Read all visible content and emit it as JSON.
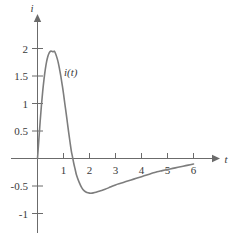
{
  "chart_data": {
    "type": "line",
    "title": "",
    "subtitle": "",
    "xlabel": "t",
    "ylabel": "i",
    "xlim": [
      -0.25,
      6.6
    ],
    "ylim": [
      -1.25,
      2.25
    ],
    "grid": false,
    "legend": "none",
    "annotations": [
      {
        "text": "i(t)",
        "x": 1.05,
        "y": 1.48
      }
    ],
    "xticks": [
      1,
      2,
      3,
      4,
      5,
      6
    ],
    "xtick_labels": [
      "1",
      "2",
      "3",
      "4",
      "5",
      "6"
    ],
    "yticks": [
      -1,
      -0.5,
      0.5,
      1,
      1.5,
      2
    ],
    "ytick_labels": [
      "-1",
      "-0.5",
      "0.5",
      "1",
      "1.5",
      "2"
    ],
    "series": [
      {
        "name": "i(t)",
        "color": "#7d7d7d",
        "x": [
          0,
          0.05,
          0.1,
          0.15,
          0.2,
          0.25,
          0.3,
          0.35,
          0.4,
          0.45,
          0.5,
          0.55,
          0.6,
          0.65,
          0.7,
          0.75,
          0.8,
          0.85,
          0.9,
          0.95,
          1.0,
          1.05,
          1.1,
          1.15,
          1.2,
          1.25,
          1.3,
          1.35,
          1.4,
          1.45,
          1.5,
          1.6,
          1.7,
          1.8,
          1.9,
          2.0,
          2.1,
          2.2,
          2.4,
          2.6,
          2.8,
          3.0,
          3.2,
          3.4,
          3.6,
          3.8,
          4.0,
          4.2,
          4.4,
          4.6,
          4.8,
          5.0,
          5.2,
          5.4,
          5.6,
          5.8,
          6.0
        ],
        "y": [
          0,
          0.33,
          0.66,
          0.96,
          1.22,
          1.44,
          1.62,
          1.76,
          1.86,
          1.92,
          1.95,
          1.95,
          1.94,
          1.95,
          1.9,
          1.83,
          1.74,
          1.62,
          1.49,
          1.34,
          1.18,
          1.0,
          0.83,
          0.65,
          0.47,
          0.3,
          0.14,
          0.02,
          -0.1,
          -0.2,
          -0.3,
          -0.43,
          -0.53,
          -0.59,
          -0.62,
          -0.63,
          -0.63,
          -0.62,
          -0.59,
          -0.56,
          -0.52,
          -0.48,
          -0.45,
          -0.42,
          -0.39,
          -0.36,
          -0.33,
          -0.3,
          -0.27,
          -0.24,
          -0.22,
          -0.2,
          -0.18,
          -0.16,
          -0.14,
          -0.12,
          -0.1
        ]
      }
    ],
    "axis_color": "#6b6b6b",
    "curve_color": "#7d7d7d",
    "peak": {
      "x": 0.62,
      "y": 1.95
    },
    "zero_crossing": {
      "x": 1.37,
      "y": 0
    },
    "minimum": {
      "x": 2.02,
      "y": -0.63
    }
  }
}
